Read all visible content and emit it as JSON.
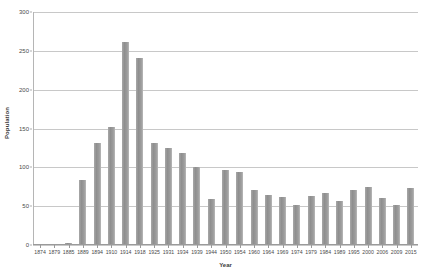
{
  "chart_data": {
    "type": "bar",
    "title": "",
    "xlabel": "Year",
    "ylabel": "Population",
    "ylim": [
      0,
      300
    ],
    "yticks": [
      0,
      50,
      100,
      150,
      200,
      250,
      300
    ],
    "grid": true,
    "legend": "none",
    "bar_color": "#9a9a9a",
    "gridline_color": "#c8c8c8",
    "categories": [
      "1874",
      "1879",
      "1885",
      "1889",
      "1894",
      "1910",
      "1914",
      "1918",
      "1925",
      "1931",
      "1934",
      "1939",
      "1944",
      "1950",
      "1954",
      "1960",
      "1964",
      "1969",
      "1974",
      "1979",
      "1984",
      "1989",
      "1995",
      "2000",
      "2006",
      "2009",
      "2015"
    ],
    "values": [
      0,
      0,
      3,
      84,
      131,
      152,
      261,
      241,
      131,
      125,
      118,
      101,
      59,
      96,
      94,
      71,
      64,
      62,
      51,
      63,
      67,
      57,
      71,
      75,
      60,
      51,
      73
    ],
    "series": [
      {
        "name": "Population",
        "values": [
          0,
          0,
          3,
          84,
          131,
          152,
          261,
          241,
          131,
          125,
          118,
          101,
          59,
          96,
          94,
          71,
          64,
          62,
          51,
          63,
          67,
          57,
          71,
          75,
          60,
          51,
          73
        ]
      }
    ]
  }
}
